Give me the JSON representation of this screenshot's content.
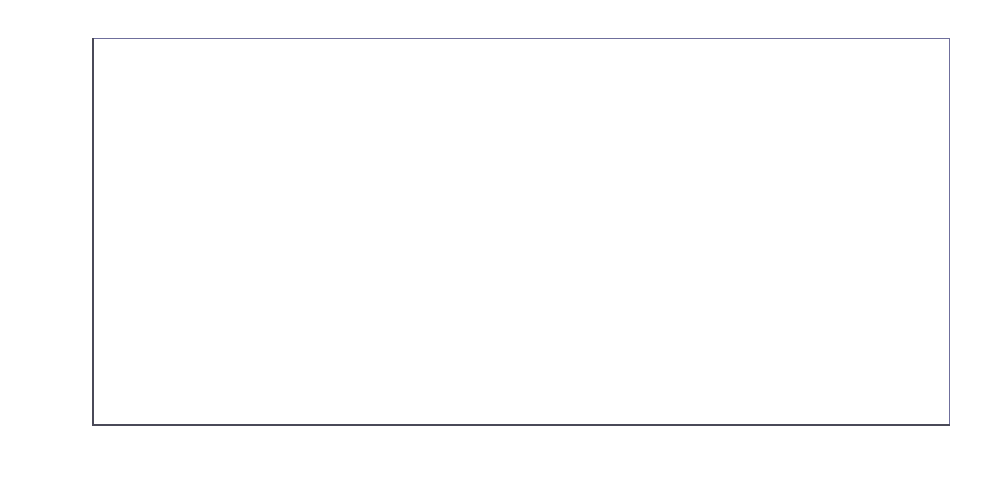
{
  "chart_data": {
    "type": "line",
    "title": "",
    "subtitle": "",
    "xlabel": "",
    "ylabel": "",
    "categories": [
      "1970",
      "1980",
      "1990",
      "2000",
      "2010",
      "2020"
    ],
    "x": [
      1970,
      1980,
      1990,
      2000,
      2010,
      2020
    ],
    "values": [
      3.1,
      4.0,
      4.8,
      5.1,
      5.8,
      7.7
    ],
    "data_labels": [
      "3,1",
      "4",
      "4,8",
      "5,1",
      "5,8",
      "7,7"
    ],
    "series": [
      {
        "name": "",
        "values": [
          3.1,
          4.0,
          4.8,
          5.1,
          5.8,
          7.7
        ],
        "color": "#e2602c",
        "marker": "diamond",
        "marker_color": "#e2602c"
      }
    ],
    "ylim": [
      3,
      8
    ],
    "yticks": [
      3,
      3.5,
      4,
      4.5,
      5,
      5.5,
      6,
      6.5,
      7,
      7.5,
      8
    ],
    "ytick_labels": [
      "3",
      "3,5",
      "4",
      "4,5",
      "5",
      "5,5",
      "6",
      "6,5",
      "7",
      "7,5",
      "8"
    ],
    "xtick_labels": [
      "1970",
      "1980",
      "1990",
      "2000",
      "2010",
      "2020"
    ],
    "grid": false,
    "legend": false,
    "legend_position": "none",
    "decimal_separator": ",",
    "annotations": [
      {
        "text": "3,1",
        "x": 1970,
        "y": 3.1
      },
      {
        "text": "4",
        "x": 1980,
        "y": 4.0
      },
      {
        "text": "4,8",
        "x": 1990,
        "y": 4.8
      },
      {
        "text": "5,1",
        "x": 2000,
        "y": 5.1
      },
      {
        "text": "5,8",
        "x": 2010,
        "y": 5.8
      },
      {
        "text": "7,7",
        "x": 2020,
        "y": 7.7
      }
    ],
    "colors": {
      "series_line": "#e2602c",
      "frame": "#6f6f9c",
      "axis": "#4a4a58",
      "tick": "#35353f",
      "label_text": "#3a3a3a",
      "background": "#ffffff"
    }
  },
  "label_offsets": [
    {
      "dx": -42,
      "dy": -68
    },
    {
      "dx": -48,
      "dy": -58
    },
    {
      "dx": -42,
      "dy": -58
    },
    {
      "dx": -48,
      "dy": -54
    },
    {
      "dx": -48,
      "dy": -52
    },
    {
      "dx": -80,
      "dy": -2
    }
  ],
  "geometry": {
    "plot_left": 92,
    "plot_right": 950,
    "plot_top": 38,
    "plot_bottom": 425,
    "x_positions": [
      215,
      338,
      461,
      584,
      706,
      827
    ],
    "extra_x_ticks": [
      92,
      950
    ]
  }
}
